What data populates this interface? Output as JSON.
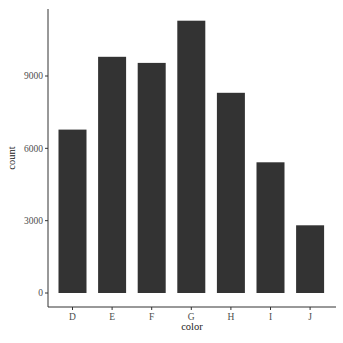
{
  "chart_data": {
    "type": "bar",
    "title": "",
    "xlabel": "color",
    "ylabel": "count",
    "categories": [
      "D",
      "E",
      "F",
      "G",
      "H",
      "I",
      "J"
    ],
    "values": [
      6775,
      9797,
      9542,
      11292,
      8304,
      5422,
      2808
    ],
    "yticks": [
      0,
      3000,
      6000,
      9000
    ],
    "ytick_labels": [
      "0",
      "3000",
      "6000",
      "9000"
    ],
    "ylim": [
      0,
      11856
    ],
    "grid": false,
    "legend": null,
    "bar_color": "#333333"
  }
}
